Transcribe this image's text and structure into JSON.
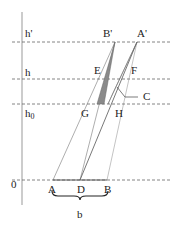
{
  "diagram": {
    "levels": [
      {
        "label": "h'",
        "y": 42
      },
      {
        "label": "h",
        "y": 79
      },
      {
        "label": "h0",
        "y": 104
      },
      {
        "label": "0",
        "y": 180
      }
    ],
    "points": {
      "A_prime": {
        "label": "A'",
        "x": 137,
        "y": 42
      },
      "B_prime": {
        "label": "B'",
        "x": 115,
        "y": 42
      },
      "E": {
        "label": "E"
      },
      "F": {
        "label": "F"
      },
      "C": {
        "label": "C"
      },
      "G": {
        "label": "G"
      },
      "H": {
        "label": "H"
      },
      "A": {
        "label": "A",
        "x": 53,
        "y": 180
      },
      "D": {
        "label": "D",
        "x": 80,
        "y": 180
      },
      "B": {
        "label": "B",
        "x": 107,
        "y": 180
      }
    },
    "brace_label": "b",
    "colors": {
      "shade": "#8a8a8a",
      "line": "#555555",
      "dash": "#666666"
    }
  }
}
